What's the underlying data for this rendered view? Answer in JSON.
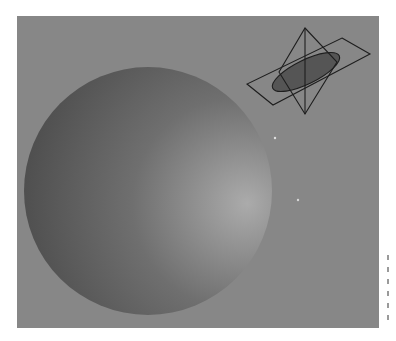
{
  "figure": {
    "background_color": "#878787",
    "panel": {
      "x": 17,
      "y": 16,
      "width": 362,
      "height": 312
    }
  },
  "sphere": {
    "cx": 148,
    "cy": 191,
    "r": 124,
    "shade_dark": "#464646",
    "shade_mid": "#6f6f6f",
    "shade_light": "#ababab"
  },
  "wireframe_icon": {
    "stroke_color": "#1e1e1e",
    "parallelogram_points": "342,38 370,54 273,105 247,84",
    "kite_points": "305,28 337,62 305,114 279,72",
    "axis_line": {
      "x1": 305,
      "y1": 28,
      "x2": 305,
      "y2": 114
    },
    "ellipse": {
      "cx": 306,
      "cy": 72,
      "rx": 37,
      "ry": 12,
      "rotate": -26,
      "fill": "#555555"
    }
  },
  "specks": [
    {
      "x": 275,
      "y": 138
    },
    {
      "x": 298,
      "y": 200
    }
  ],
  "margin_marks_count": 6
}
